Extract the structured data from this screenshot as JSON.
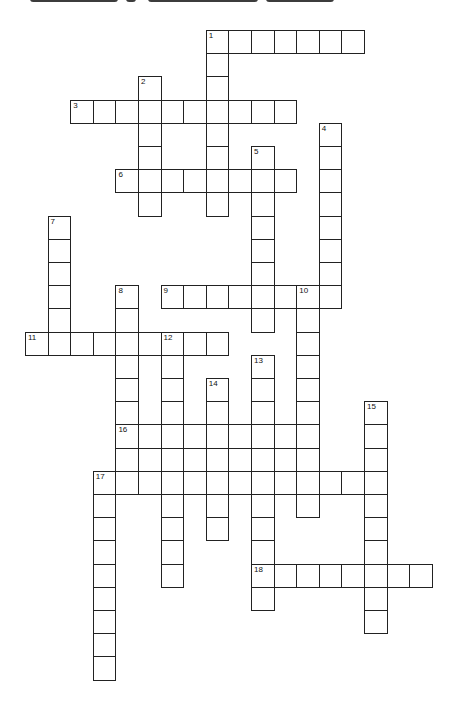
{
  "puzzle": {
    "layout": {
      "origin_x": 25,
      "origin_y": 30,
      "cell_w": 22.6,
      "cell_h": 23.2
    },
    "words": [
      {
        "number": "1",
        "direction": "across",
        "row": 0,
        "col": 8,
        "length": 7
      },
      {
        "number": "1",
        "direction": "down",
        "row": 0,
        "col": 8,
        "length": 8
      },
      {
        "number": "2",
        "direction": "down",
        "row": 2,
        "col": 5,
        "length": 6
      },
      {
        "number": "3",
        "direction": "across",
        "row": 3,
        "col": 2,
        "length": 10
      },
      {
        "number": "4",
        "direction": "down",
        "row": 4,
        "col": 13,
        "length": 8
      },
      {
        "number": "5",
        "direction": "down",
        "row": 5,
        "col": 10,
        "length": 8
      },
      {
        "number": "6",
        "direction": "across",
        "row": 6,
        "col": 4,
        "length": 8
      },
      {
        "number": "7",
        "direction": "down",
        "row": 8,
        "col": 1,
        "length": 6
      },
      {
        "number": "8",
        "direction": "down",
        "row": 11,
        "col": 4,
        "length": 9
      },
      {
        "number": "9",
        "direction": "across",
        "row": 11,
        "col": 6,
        "length": 8
      },
      {
        "number": "10",
        "direction": "down",
        "row": 11,
        "col": 12,
        "length": 10
      },
      {
        "number": "11",
        "direction": "across",
        "row": 13,
        "col": 0,
        "length": 9
      },
      {
        "number": "12",
        "direction": "down",
        "row": 13,
        "col": 6,
        "length": 11
      },
      {
        "number": "13",
        "direction": "down",
        "row": 14,
        "col": 10,
        "length": 11
      },
      {
        "number": "14",
        "direction": "down",
        "row": 15,
        "col": 8,
        "length": 7
      },
      {
        "number": "15",
        "direction": "down",
        "row": 16,
        "col": 15,
        "length": 10
      },
      {
        "number": "16",
        "direction": "across",
        "row": 17,
        "col": 4,
        "length": 9
      },
      {
        "number": "",
        "direction": "across",
        "row": 18,
        "col": 4,
        "length": 9
      },
      {
        "number": "17",
        "direction": "across",
        "row": 19,
        "col": 3,
        "length": 13
      },
      {
        "number": "17",
        "direction": "down",
        "row": 19,
        "col": 3,
        "length": 9
      },
      {
        "number": "18",
        "direction": "across",
        "row": 23,
        "col": 10,
        "length": 8
      }
    ]
  },
  "header": {
    "title_visible": false
  }
}
